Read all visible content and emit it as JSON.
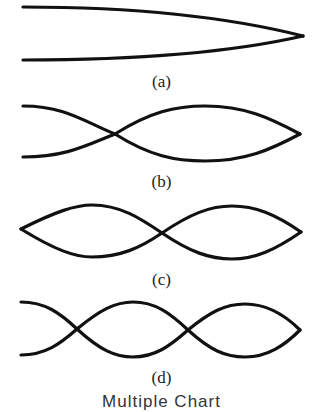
{
  "panels": [
    {
      "id": "a",
      "label": "(a)",
      "description": "fundamental mode: single loop, node at right end"
    },
    {
      "id": "b",
      "label": "(b)",
      "description": "two crossings: node near left third, loop to right end"
    },
    {
      "id": "c",
      "label": "(c)",
      "description": "two full loops with node at center"
    },
    {
      "id": "d",
      "label": "(d)",
      "description": "three segments with two nodes"
    }
  ],
  "caption": "Multiple Chart",
  "colors": {
    "stroke": "#111111",
    "background": "#ffffff"
  }
}
